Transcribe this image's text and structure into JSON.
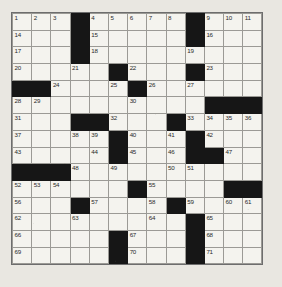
{
  "puzzle": {
    "type": "crossword-grid",
    "rows": 15,
    "columns": 13,
    "cell_colors": {
      "open": "#f4f3ee",
      "block": "#161616",
      "grid_line": "#9b9a95",
      "border": "#6d6d6d",
      "page_background": "#e9e7e1",
      "number_text": "#2a2a2a"
    },
    "grid": [
      [
        {
          "type": "open",
          "number": "1"
        },
        {
          "type": "open",
          "number": "2"
        },
        {
          "type": "open",
          "number": "3"
        },
        {
          "type": "block",
          "number": ""
        },
        {
          "type": "open",
          "number": "4"
        },
        {
          "type": "open",
          "number": "5"
        },
        {
          "type": "open",
          "number": "6"
        },
        {
          "type": "open",
          "number": "7"
        },
        {
          "type": "open",
          "number": "8"
        },
        {
          "type": "block",
          "number": ""
        },
        {
          "type": "open",
          "number": "9"
        },
        {
          "type": "open",
          "number": "10"
        },
        {
          "type": "open",
          "number": "11"
        }
      ],
      [
        {
          "type": "open",
          "number": "14"
        },
        {
          "type": "open",
          "number": ""
        },
        {
          "type": "open",
          "number": ""
        },
        {
          "type": "block",
          "number": ""
        },
        {
          "type": "open",
          "number": "15"
        },
        {
          "type": "open",
          "number": ""
        },
        {
          "type": "open",
          "number": ""
        },
        {
          "type": "open",
          "number": ""
        },
        {
          "type": "open",
          "number": ""
        },
        {
          "type": "block",
          "number": ""
        },
        {
          "type": "open",
          "number": "16"
        },
        {
          "type": "open",
          "number": ""
        },
        {
          "type": "open",
          "number": ""
        }
      ],
      [
        {
          "type": "open",
          "number": "17"
        },
        {
          "type": "open",
          "number": ""
        },
        {
          "type": "open",
          "number": ""
        },
        {
          "type": "block",
          "number": ""
        },
        {
          "type": "open",
          "number": "18"
        },
        {
          "type": "open",
          "number": ""
        },
        {
          "type": "open",
          "number": ""
        },
        {
          "type": "open",
          "number": ""
        },
        {
          "type": "open",
          "number": ""
        },
        {
          "type": "open",
          "number": "19"
        },
        {
          "type": "open",
          "number": ""
        },
        {
          "type": "open",
          "number": ""
        },
        {
          "type": "open",
          "number": ""
        }
      ],
      [
        {
          "type": "open",
          "number": "20"
        },
        {
          "type": "open",
          "number": ""
        },
        {
          "type": "open",
          "number": ""
        },
        {
          "type": "open",
          "number": "21"
        },
        {
          "type": "open",
          "number": ""
        },
        {
          "type": "block",
          "number": ""
        },
        {
          "type": "open",
          "number": "22"
        },
        {
          "type": "open",
          "number": ""
        },
        {
          "type": "open",
          "number": ""
        },
        {
          "type": "block",
          "number": ""
        },
        {
          "type": "open",
          "number": "23"
        },
        {
          "type": "open",
          "number": ""
        },
        {
          "type": "open",
          "number": ""
        }
      ],
      [
        {
          "type": "block",
          "number": ""
        },
        {
          "type": "block",
          "number": ""
        },
        {
          "type": "open",
          "number": "24"
        },
        {
          "type": "open",
          "number": ""
        },
        {
          "type": "open",
          "number": ""
        },
        {
          "type": "open",
          "number": "25"
        },
        {
          "type": "block",
          "number": ""
        },
        {
          "type": "open",
          "number": "26"
        },
        {
          "type": "open",
          "number": ""
        },
        {
          "type": "open",
          "number": "27"
        },
        {
          "type": "open",
          "number": ""
        },
        {
          "type": "open",
          "number": ""
        },
        {
          "type": "open",
          "number": ""
        }
      ],
      [
        {
          "type": "open",
          "number": "28"
        },
        {
          "type": "open",
          "number": "29"
        },
        {
          "type": "open",
          "number": ""
        },
        {
          "type": "open",
          "number": ""
        },
        {
          "type": "open",
          "number": ""
        },
        {
          "type": "open",
          "number": ""
        },
        {
          "type": "open",
          "number": "30"
        },
        {
          "type": "open",
          "number": ""
        },
        {
          "type": "open",
          "number": ""
        },
        {
          "type": "open",
          "number": ""
        },
        {
          "type": "block",
          "number": ""
        },
        {
          "type": "block",
          "number": ""
        },
        {
          "type": "block",
          "number": ""
        }
      ],
      [
        {
          "type": "open",
          "number": "31"
        },
        {
          "type": "open",
          "number": ""
        },
        {
          "type": "open",
          "number": ""
        },
        {
          "type": "block",
          "number": ""
        },
        {
          "type": "block",
          "number": ""
        },
        {
          "type": "open",
          "number": "32"
        },
        {
          "type": "open",
          "number": ""
        },
        {
          "type": "open",
          "number": ""
        },
        {
          "type": "block",
          "number": ""
        },
        {
          "type": "open",
          "number": "33"
        },
        {
          "type": "open",
          "number": "34"
        },
        {
          "type": "open",
          "number": "35"
        },
        {
          "type": "open",
          "number": "36"
        }
      ],
      [
        {
          "type": "open",
          "number": "37"
        },
        {
          "type": "open",
          "number": ""
        },
        {
          "type": "open",
          "number": ""
        },
        {
          "type": "open",
          "number": "38"
        },
        {
          "type": "open",
          "number": "39"
        },
        {
          "type": "block",
          "number": ""
        },
        {
          "type": "open",
          "number": "40"
        },
        {
          "type": "open",
          "number": ""
        },
        {
          "type": "open",
          "number": "41"
        },
        {
          "type": "block",
          "number": ""
        },
        {
          "type": "open",
          "number": "42"
        },
        {
          "type": "open",
          "number": ""
        },
        {
          "type": "open",
          "number": ""
        }
      ],
      [
        {
          "type": "open",
          "number": "43"
        },
        {
          "type": "open",
          "number": ""
        },
        {
          "type": "open",
          "number": ""
        },
        {
          "type": "open",
          "number": ""
        },
        {
          "type": "open",
          "number": "44"
        },
        {
          "type": "block",
          "number": ""
        },
        {
          "type": "open",
          "number": "45"
        },
        {
          "type": "open",
          "number": ""
        },
        {
          "type": "open",
          "number": "46"
        },
        {
          "type": "block",
          "number": ""
        },
        {
          "type": "block",
          "number": ""
        },
        {
          "type": "open",
          "number": "47"
        },
        {
          "type": "open",
          "number": ""
        }
      ],
      [
        {
          "type": "block",
          "number": ""
        },
        {
          "type": "block",
          "number": ""
        },
        {
          "type": "block",
          "number": ""
        },
        {
          "type": "open",
          "number": "48"
        },
        {
          "type": "open",
          "number": ""
        },
        {
          "type": "open",
          "number": "49"
        },
        {
          "type": "open",
          "number": ""
        },
        {
          "type": "open",
          "number": ""
        },
        {
          "type": "open",
          "number": "50"
        },
        {
          "type": "open",
          "number": "51"
        },
        {
          "type": "open",
          "number": ""
        },
        {
          "type": "open",
          "number": ""
        },
        {
          "type": "open",
          "number": ""
        }
      ],
      [
        {
          "type": "open",
          "number": "52"
        },
        {
          "type": "open",
          "number": "53"
        },
        {
          "type": "open",
          "number": "54"
        },
        {
          "type": "open",
          "number": ""
        },
        {
          "type": "open",
          "number": ""
        },
        {
          "type": "open",
          "number": ""
        },
        {
          "type": "block",
          "number": ""
        },
        {
          "type": "open",
          "number": "55"
        },
        {
          "type": "open",
          "number": ""
        },
        {
          "type": "open",
          "number": ""
        },
        {
          "type": "open",
          "number": ""
        },
        {
          "type": "block",
          "number": ""
        },
        {
          "type": "block",
          "number": ""
        }
      ],
      [
        {
          "type": "open",
          "number": "56"
        },
        {
          "type": "open",
          "number": ""
        },
        {
          "type": "open",
          "number": ""
        },
        {
          "type": "block",
          "number": ""
        },
        {
          "type": "open",
          "number": "57"
        },
        {
          "type": "open",
          "number": ""
        },
        {
          "type": "open",
          "number": ""
        },
        {
          "type": "open",
          "number": "58"
        },
        {
          "type": "block",
          "number": ""
        },
        {
          "type": "open",
          "number": "59"
        },
        {
          "type": "open",
          "number": ""
        },
        {
          "type": "open",
          "number": "60"
        },
        {
          "type": "open",
          "number": "61"
        }
      ],
      [
        {
          "type": "open",
          "number": "62"
        },
        {
          "type": "open",
          "number": ""
        },
        {
          "type": "open",
          "number": ""
        },
        {
          "type": "open",
          "number": "63"
        },
        {
          "type": "open",
          "number": ""
        },
        {
          "type": "open",
          "number": ""
        },
        {
          "type": "open",
          "number": ""
        },
        {
          "type": "open",
          "number": "64"
        },
        {
          "type": "open",
          "number": ""
        },
        {
          "type": "block",
          "number": ""
        },
        {
          "type": "open",
          "number": "65"
        },
        {
          "type": "open",
          "number": ""
        },
        {
          "type": "open",
          "number": ""
        }
      ],
      [
        {
          "type": "open",
          "number": "66"
        },
        {
          "type": "open",
          "number": ""
        },
        {
          "type": "open",
          "number": ""
        },
        {
          "type": "open",
          "number": ""
        },
        {
          "type": "open",
          "number": ""
        },
        {
          "type": "block",
          "number": ""
        },
        {
          "type": "open",
          "number": "67"
        },
        {
          "type": "open",
          "number": ""
        },
        {
          "type": "open",
          "number": ""
        },
        {
          "type": "block",
          "number": ""
        },
        {
          "type": "open",
          "number": "68"
        },
        {
          "type": "open",
          "number": ""
        },
        {
          "type": "open",
          "number": ""
        }
      ],
      [
        {
          "type": "open",
          "number": "69"
        },
        {
          "type": "open",
          "number": ""
        },
        {
          "type": "open",
          "number": ""
        },
        {
          "type": "open",
          "number": ""
        },
        {
          "type": "open",
          "number": ""
        },
        {
          "type": "block",
          "number": ""
        },
        {
          "type": "open",
          "number": "70"
        },
        {
          "type": "open",
          "number": ""
        },
        {
          "type": "open",
          "number": ""
        },
        {
          "type": "block",
          "number": ""
        },
        {
          "type": "open",
          "number": "71"
        },
        {
          "type": "open",
          "number": ""
        },
        {
          "type": "open",
          "number": ""
        }
      ]
    ]
  }
}
